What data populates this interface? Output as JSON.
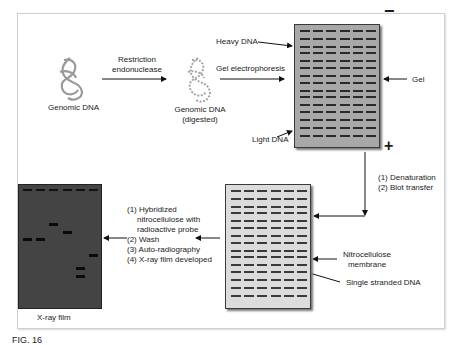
{
  "figure": {
    "caption": "FIG. 16"
  },
  "steps": {
    "genomic_dna": "Genomic DNA",
    "restriction_line1": "Restriction",
    "restriction_line2": "endonuclease",
    "digested_line1": "Genomic DNA",
    "digested_line2": "(digested)",
    "gel_electrophoresis": "Gel electrophoresis",
    "heavy_dna": "Heavy DNA",
    "light_dna": "Light DNA",
    "gel": "Gel",
    "minus_sign": "−",
    "plus_sign": "+",
    "blot_step1": "(1) Denaturation",
    "blot_step2": "(2) Blot transfer",
    "nitrocellulose_line1": "Nitrocellulose",
    "nitrocellulose_line2": "membrane",
    "single_stranded_dna": "Single stranded DNA",
    "hybrid_step1": "(1) Hybridized",
    "hybrid_step1b": "nitrocellulose with",
    "hybrid_step1c": "radioactive probe",
    "hybrid_step2": "(2) Wash",
    "hybrid_step3": "(3) Auto-radiography",
    "hybrid_step4": "(4) X-ray film developed",
    "xray_film": "X-ray film"
  },
  "gel": {
    "columns": 6,
    "row_offsets_px": [
      5,
      13,
      21,
      27,
      35,
      42,
      50,
      57,
      65,
      71,
      79,
      86,
      94,
      102,
      110
    ],
    "color": "#a8a8a8"
  },
  "membrane": {
    "columns": 6,
    "row_offsets_px": [
      5,
      13,
      21,
      27,
      35,
      42,
      50,
      57,
      65,
      71,
      79,
      86,
      94,
      102,
      110
    ],
    "color": "#dcdcdc"
  },
  "xray_film": {
    "columns": 6,
    "top_marks_offset_px": 4,
    "bands": [
      {
        "column": 0,
        "offset_px": 53
      },
      {
        "column": 1,
        "offset_px": 53
      },
      {
        "column": 2,
        "offset_px": 38
      },
      {
        "column": 3,
        "offset_px": 46
      },
      {
        "column": 4,
        "offset_px": 82
      },
      {
        "column": 4,
        "offset_px": 90
      },
      {
        "column": 5,
        "offset_px": 69
      }
    ],
    "color": "#444444"
  }
}
